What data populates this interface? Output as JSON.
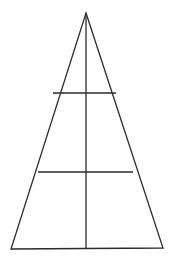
{
  "figure": {
    "type": "geometric-line-drawing",
    "canvas": {
      "width": 172,
      "height": 263,
      "background_color": "#ffffff"
    },
    "style": {
      "stroke_color": "#2b2b2b",
      "stroke_width": 1.3,
      "fill": "none"
    },
    "points": {
      "apex": {
        "x": 86,
        "y": 13
      },
      "bottom_left": {
        "x": 11,
        "y": 249
      },
      "bottom_right": {
        "x": 163,
        "y": 248
      }
    },
    "shapes": [
      {
        "name": "triangle-outline",
        "kind": "polygon",
        "points": "86,13 163,248 11,249",
        "closed": true
      },
      {
        "name": "vertical-median",
        "kind": "line",
        "x1": 86,
        "y1": 13,
        "x2": 86,
        "y2": 248.5
      },
      {
        "name": "upper-horizontal-chord",
        "kind": "line",
        "x1": 53,
        "y1": 93,
        "x2": 116,
        "y2": 93
      },
      {
        "name": "lower-horizontal-chord",
        "kind": "line",
        "x1": 38,
        "y1": 172,
        "x2": 133,
        "y2": 172
      }
    ],
    "labels": []
  }
}
